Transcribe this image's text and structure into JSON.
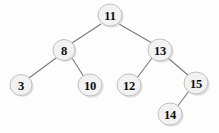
{
  "figure": {
    "background_color": "#fdfdfd",
    "width": 219,
    "height": 133
  },
  "style": {
    "node_fill": "#f2f2f2",
    "node_stroke": "#b9b9b9",
    "node_shadow": "#c9c9c9",
    "edge_color": "#7b7b7b",
    "label_color": "#0d0d0d"
  },
  "chart_data": {
    "type": "diagram",
    "diagram_kind": "binary-search-tree",
    "root": "11",
    "nodes": [
      {
        "id": "n11",
        "label": "11",
        "x": 110,
        "y": 15,
        "rx": 12,
        "ry": 11,
        "depth": 0
      },
      {
        "id": "n8",
        "label": "8",
        "x": 64,
        "y": 50,
        "rx": 11,
        "ry": 10.5,
        "depth": 1
      },
      {
        "id": "n13",
        "label": "13",
        "x": 160,
        "y": 50,
        "rx": 12,
        "ry": 11,
        "depth": 1
      },
      {
        "id": "n3",
        "label": "3",
        "x": 21,
        "y": 85,
        "rx": 11,
        "ry": 10.5,
        "depth": 2
      },
      {
        "id": "n10",
        "label": "10",
        "x": 90,
        "y": 85,
        "rx": 12,
        "ry": 11,
        "depth": 2
      },
      {
        "id": "n12",
        "label": "12",
        "x": 129,
        "y": 85,
        "rx": 12,
        "ry": 11,
        "depth": 2
      },
      {
        "id": "n15",
        "label": "15",
        "x": 196,
        "y": 83,
        "rx": 12,
        "ry": 11,
        "depth": 2
      },
      {
        "id": "n14",
        "label": "14",
        "x": 170,
        "y": 114,
        "rx": 12,
        "ry": 11,
        "depth": 3
      }
    ],
    "edges": [
      {
        "from": "n11",
        "to": "n8",
        "side": "left",
        "x1": 101,
        "y1": 24,
        "x2": 72,
        "y2": 43
      },
      {
        "from": "n11",
        "to": "n13",
        "side": "right",
        "x1": 119,
        "y1": 24,
        "x2": 152,
        "y2": 43
      },
      {
        "from": "n8",
        "to": "n3",
        "side": "left",
        "x1": 56,
        "y1": 58,
        "x2": 29,
        "y2": 78
      },
      {
        "from": "n8",
        "to": "n10",
        "side": "right",
        "x1": 72,
        "y1": 58,
        "x2": 84,
        "y2": 77
      },
      {
        "from": "n13",
        "to": "n12",
        "side": "left",
        "x1": 152,
        "y1": 58,
        "x2": 137,
        "y2": 78
      },
      {
        "from": "n13",
        "to": "n15",
        "side": "right",
        "x1": 168,
        "y1": 58,
        "x2": 189,
        "y2": 76
      },
      {
        "from": "n15",
        "to": "n14",
        "side": "left",
        "x1": 189,
        "y1": 91,
        "x2": 177,
        "y2": 107
      }
    ],
    "values": [
      11,
      8,
      13,
      3,
      10,
      12,
      15,
      14
    ],
    "inorder": [
      3,
      8,
      10,
      11,
      12,
      13,
      14,
      15
    ],
    "relationships": [
      "11 is the root",
      "8 is the left child of 11",
      "13 is the right child of 11",
      "3 is the left child of 8",
      "10 is the right child of 8",
      "12 is the left child of 13",
      "15 is the right child of 13",
      "14 is the left child of 15"
    ]
  }
}
